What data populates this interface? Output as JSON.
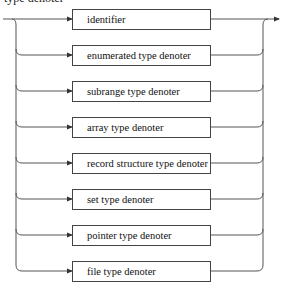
{
  "diagram": {
    "heading": "type denoter",
    "type": "syntax diagram (railroad)",
    "alternatives": [
      {
        "label": "identifier"
      },
      {
        "label": "enumerated type denoter"
      },
      {
        "label": "subrange type denoter"
      },
      {
        "label": "array type denoter"
      },
      {
        "label": "record structure type denoter"
      },
      {
        "label": "set type denoter"
      },
      {
        "label": "pointer type denoter"
      },
      {
        "label": "file type denoter"
      }
    ],
    "colors": {
      "line": "#444444",
      "text": "#111111",
      "background": "#ffffff"
    }
  }
}
